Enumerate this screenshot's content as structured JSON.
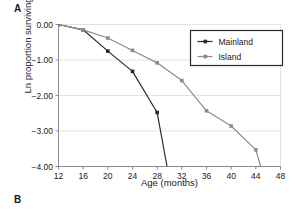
{
  "figure": {
    "panel_a_label": "A",
    "panel_b_label": "B"
  },
  "chart_data": {
    "type": "line",
    "title": "",
    "xlabel": "Age (months)",
    "ylabel": "Ln proportion surviving",
    "xlim": [
      12,
      48
    ],
    "ylim": [
      -4.0,
      0.0
    ],
    "xticks": [
      12,
      16,
      20,
      24,
      28,
      32,
      36,
      40,
      44,
      48
    ],
    "xtick_labels": [
      "12",
      "16",
      "20",
      "24",
      "28",
      "32",
      "36",
      "40",
      "44",
      "48"
    ],
    "yticks": [
      0.0,
      -1.0,
      -2.0,
      -3.0,
      -4.0
    ],
    "ytick_labels": [
      "0.00",
      "-1.00",
      "-2.00",
      "-3.00",
      "-4.00"
    ],
    "grid": "horizontal",
    "legend_position": "top-right",
    "series": [
      {
        "name": "Mainland",
        "color": "#2b2b2b",
        "marker": "square",
        "x": [
          12,
          16,
          20,
          24,
          28,
          29.6
        ],
        "y": [
          0.0,
          -0.15,
          -0.75,
          -1.32,
          -2.48,
          -4.0
        ]
      },
      {
        "name": "Island",
        "color": "#8c8c8c",
        "marker": "square",
        "x": [
          12,
          16,
          20,
          24,
          28,
          32,
          36,
          40,
          44,
          44.8
        ],
        "y": [
          0.0,
          -0.15,
          -0.38,
          -0.73,
          -1.08,
          -1.58,
          -2.43,
          -2.86,
          -3.53,
          -4.0
        ]
      }
    ]
  }
}
